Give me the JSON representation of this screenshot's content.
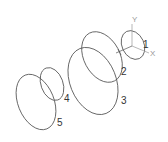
{
  "colors": {
    "stroke": "#555555",
    "axis": "#999999",
    "label": "#333333",
    "background": "#ffffff"
  },
  "axes": {
    "x_label": "X",
    "y_label": "Y"
  },
  "ellipses": [
    {
      "id": "1",
      "label": "1"
    },
    {
      "id": "2",
      "label": "2"
    },
    {
      "id": "3",
      "label": "3"
    },
    {
      "id": "4",
      "label": "4"
    },
    {
      "id": "5",
      "label": "5"
    }
  ]
}
